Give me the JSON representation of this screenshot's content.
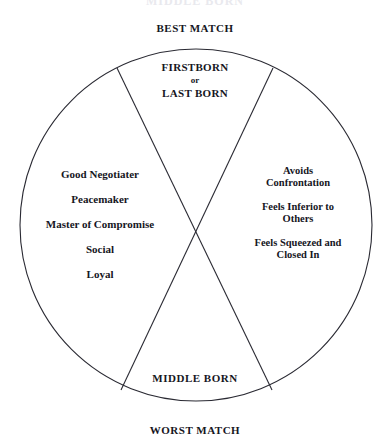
{
  "figure": {
    "background_color": "#ffffff",
    "ink_color": "#16161e",
    "clipped_title": "MIDDLE BORN"
  },
  "outer_labels": {
    "top": "BEST MATCH",
    "bottom": "WORST MATCH"
  },
  "wheel": {
    "center_x": 196,
    "center_y": 225,
    "radius": 176,
    "stroke_color": "#2a2a33",
    "stroke_width": 1
  },
  "wedges": {
    "top": {
      "heading_line_1": "FIRSTBORN",
      "conjunction": "or",
      "heading_line_2": "LAST BORN"
    },
    "left": {
      "traits": [
        "Good Negotiater",
        "Peacemaker",
        "Master of Compromise",
        "Social",
        "Loyal"
      ]
    },
    "right": {
      "traits": [
        {
          "line_1": "Avoids",
          "line_2": "Confrontation"
        },
        {
          "line_1": "Feels Inferior to",
          "line_2": "Others"
        },
        {
          "line_1": "Feels Squeezed and",
          "line_2": "Closed In"
        }
      ]
    },
    "bottom": {
      "label": "MIDDLE BORN"
    }
  }
}
